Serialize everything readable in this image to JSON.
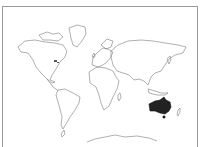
{
  "map": {
    "type": "world-outline",
    "title_fragment": "",
    "highlighted_region": {
      "name": "Australia",
      "fill": "#222222"
    },
    "outline_color": "#7a7a7a",
    "background": "#ffffff",
    "frame_border": "#9a9a9a",
    "continents": [
      "North America",
      "South America",
      "Europe",
      "Africa",
      "Asia",
      "Australia",
      "Antarctica",
      "Greenland"
    ]
  }
}
